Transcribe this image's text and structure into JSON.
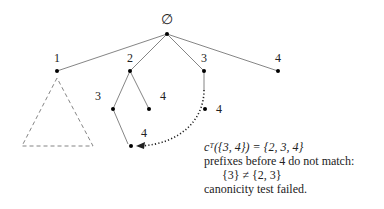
{
  "diagram": {
    "root": {
      "label": "∅"
    },
    "nodes": [
      {
        "id": "n1",
        "label": "1"
      },
      {
        "id": "n2",
        "label": "2"
      },
      {
        "id": "n3",
        "label": "3"
      },
      {
        "id": "n4",
        "label": "4"
      },
      {
        "id": "n23",
        "label": "3"
      },
      {
        "id": "n24",
        "label": "4"
      },
      {
        "id": "n34",
        "label": "4"
      },
      {
        "id": "n234",
        "label": "4"
      }
    ],
    "subtree_placeholder": "dashed triangle under node 1",
    "back_arrow": "dotted arrow from node {3,4} to node {2,3,4}"
  },
  "note": {
    "line1": "cᵀ({3, 4}) = {2, 3, 4}",
    "line2": "prefixes before 4 do not match:",
    "line3": "{3} ≠ {2, 3}",
    "line4": "canonicity test failed."
  }
}
